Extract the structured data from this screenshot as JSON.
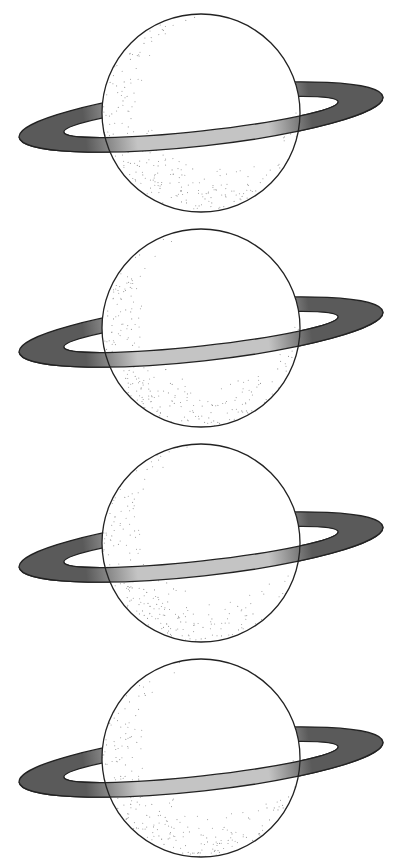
{
  "colors": {
    "background": "#ffffff",
    "outline": "#222222",
    "ring_dark": "#5a5a5a",
    "ring_light": "#c4c4c4",
    "stipple": "#9a9a9a",
    "planet_fill": "#ffffff"
  },
  "planets": [
    {
      "name": "ringed-planet-1",
      "top": 14
    },
    {
      "name": "ringed-planet-2",
      "top": 229
    },
    {
      "name": "ringed-planet-3",
      "top": 444
    },
    {
      "name": "ringed-planet-4",
      "top": 659
    }
  ],
  "geometry": {
    "planet_radius": 99,
    "planet_cx": 201,
    "ring_cx": 201,
    "ring_cy_offset": 103,
    "ring_angle_deg": -6.3,
    "ring_outer_rx": 183,
    "ring_outer_ry": 29,
    "ring_inner_rx": 138,
    "ring_inner_ry": 14
  }
}
